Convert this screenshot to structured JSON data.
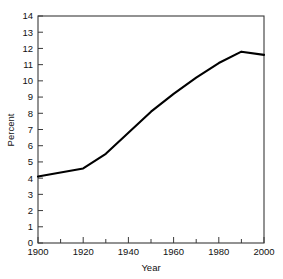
{
  "chart_data": {
    "type": "line",
    "title": "",
    "xlabel": "Year",
    "ylabel": "Percent",
    "xlim": [
      1900,
      2000
    ],
    "ylim": [
      0,
      14
    ],
    "grid": false,
    "legend": null,
    "x_ticks": [
      1900,
      1910,
      1920,
      1930,
      1940,
      1950,
      1960,
      1970,
      1980,
      1990,
      2000
    ],
    "x_tick_labels": [
      "1900",
      "",
      "1920",
      "",
      "1940",
      "",
      "1960",
      "",
      "1980",
      "",
      "2000"
    ],
    "y_ticks": [
      0,
      1,
      2,
      3,
      4,
      5,
      6,
      7,
      8,
      9,
      10,
      11,
      12,
      13,
      14
    ],
    "y_tick_labels": [
      "0",
      "1",
      "2",
      "3",
      "4",
      "5",
      "6",
      "7",
      "8",
      "9",
      "10",
      "11",
      "12",
      "13",
      "14"
    ],
    "series": [
      {
        "name": "Percent",
        "color": "#000000",
        "x": [
          1900,
          1920,
          1930,
          1940,
          1950,
          1960,
          1970,
          1980,
          1990,
          2000
        ],
        "values": [
          4.1,
          4.6,
          5.5,
          6.8,
          8.1,
          9.2,
          10.2,
          11.1,
          11.8,
          11.6
        ]
      }
    ],
    "axis_color": "#3a3a3a",
    "background": "#ffffff"
  },
  "labels": {
    "xlabel": "Year",
    "ylabel": "Percent"
  }
}
